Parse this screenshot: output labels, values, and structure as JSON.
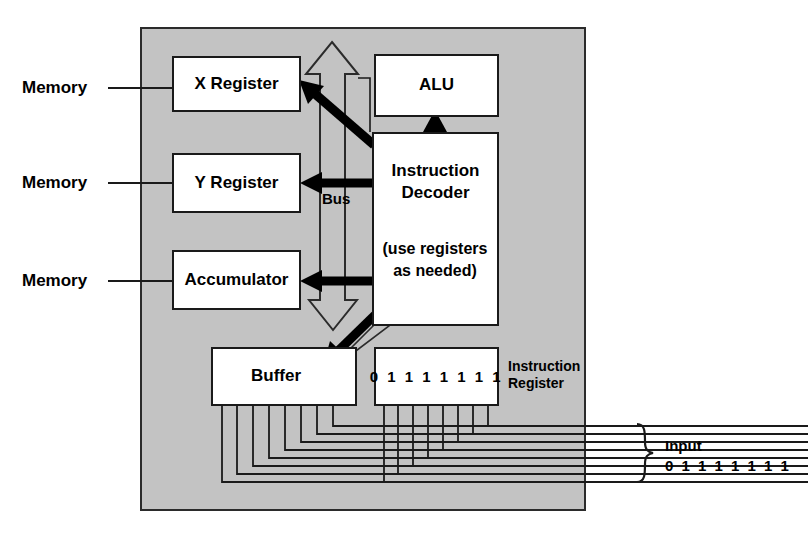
{
  "figure": {
    "panel_color": "#c3c3c3",
    "box_fill": "#ffffff",
    "line_color": "#1a1a1a"
  },
  "memory_labels": [
    {
      "text": "Memory"
    },
    {
      "text": "Memory"
    },
    {
      "text": "Memory"
    }
  ],
  "boxes": {
    "x_register": "X Register",
    "y_register": "Y Register",
    "accumulator": "Accumulator",
    "alu": "ALU",
    "instruction_decoder_line1": "Instruction",
    "instruction_decoder_line2": "Decoder",
    "instruction_decoder_note1": "(use registers",
    "instruction_decoder_note2": "as needed)",
    "buffer": "Buffer",
    "instruction_register_bits": "0 1 1 1 1 1 1 1"
  },
  "annotations": {
    "bus": "Bus",
    "instruction_register_line1": "Instruction",
    "instruction_register_line2": "Register",
    "input_title": "Input",
    "input_bits": "0 1 1 1 1 1 1 1"
  }
}
